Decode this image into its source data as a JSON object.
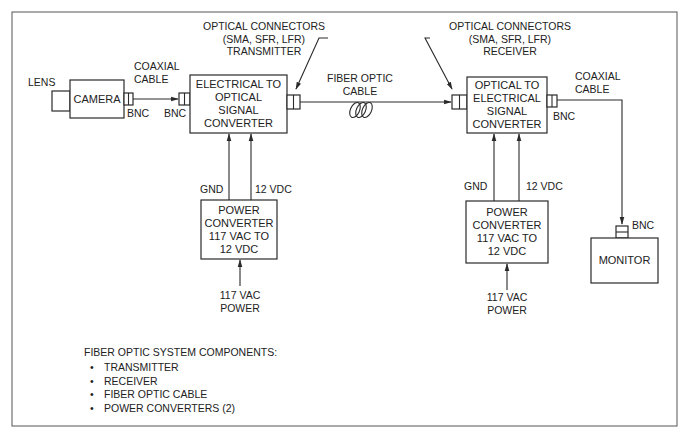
{
  "diagram": {
    "colors": {
      "line": "#2a2a2a",
      "text": "#222222",
      "background": "#ffffff"
    },
    "nodes": {
      "lens": {
        "label": "LENS"
      },
      "camera": {
        "label": "CAMERA"
      },
      "transmitter": {
        "lines": [
          "ELECTRICAL TO",
          "OPTICAL",
          "SIGNAL",
          "CONVERTER"
        ]
      },
      "receiver": {
        "lines": [
          "OPTICAL TO",
          "ELECTRICAL",
          "SIGNAL",
          "CONVERTER"
        ]
      },
      "power_converter_tx": {
        "lines": [
          "POWER",
          "CONVERTER",
          "117 VAC TO",
          "12 VDC"
        ]
      },
      "power_converter_rx": {
        "lines": [
          "POWER",
          "CONVERTER",
          "117 VAC TO",
          "12 VDC"
        ]
      },
      "monitor": {
        "label": "MONITOR"
      }
    },
    "labels": {
      "coax_cable_left": [
        "COAXIAL",
        "CABLE"
      ],
      "coax_cable_right": [
        "COAXIAL",
        "CABLE"
      ],
      "bnc_camera": "BNC",
      "bnc_tx_in": "BNC",
      "bnc_rx_out": "BNC",
      "bnc_monitor": "BNC",
      "optical_connectors_tx": [
        "OPTICAL CONNECTORS",
        "(SMA, SFR, LFR)",
        "TRANSMITTER"
      ],
      "optical_connectors_rx": [
        "OPTICAL CONNECTORS",
        "(SMA, SFR, LFR)",
        "RECEIVER"
      ],
      "fiber_optic_cable": [
        "FIBER OPTIC",
        "CABLE"
      ],
      "gnd_tx": "GND",
      "vdc_tx": "12 VDC",
      "gnd_rx": "GND",
      "vdc_rx": "12 VDC",
      "ac_power_tx": [
        "117 VAC",
        "POWER"
      ],
      "ac_power_rx": [
        "117 VAC",
        "POWER"
      ]
    },
    "edges": [
      {
        "from": "camera",
        "to": "transmitter",
        "label": "COAXIAL CABLE"
      },
      {
        "from": "transmitter",
        "to": "receiver",
        "label": "FIBER OPTIC CABLE"
      },
      {
        "from": "receiver",
        "to": "monitor",
        "label": "COAXIAL CABLE"
      },
      {
        "from": "power_converter_tx",
        "to": "transmitter",
        "label": "GND"
      },
      {
        "from": "power_converter_tx",
        "to": "transmitter",
        "label": "12 VDC"
      },
      {
        "from": "power_converter_rx",
        "to": "receiver",
        "label": "GND"
      },
      {
        "from": "power_converter_rx",
        "to": "receiver",
        "label": "12 VDC"
      },
      {
        "from": "117 VAC POWER",
        "to": "power_converter_tx"
      },
      {
        "from": "117 VAC POWER",
        "to": "power_converter_rx"
      }
    ],
    "legend": {
      "title": "FIBER OPTIC SYSTEM COMPONENTS:",
      "items": [
        "TRANSMITTER",
        "RECEIVER",
        "FIBER OPTIC CABLE",
        "POWER CONVERTERS (2)"
      ]
    }
  }
}
